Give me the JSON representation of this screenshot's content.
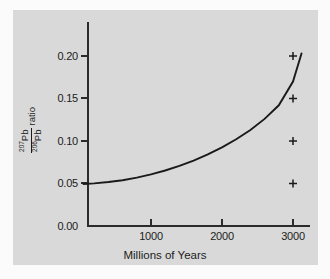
{
  "figure": {
    "background_color": "#fbfbfb",
    "panel_color": "#d9d9d9",
    "axis_color": "#2b2b2b",
    "curve_color": "#1a1a1a"
  },
  "axis_labels": {
    "x_label": "Millions of Years",
    "y_numerator_sup": "207",
    "y_numerator_el": "Pb",
    "y_denominator_sup": "206",
    "y_denominator_el": "Pb",
    "y_ratio_word": "ratio"
  },
  "chart_data": {
    "type": "line",
    "title": "",
    "xlabel": "Millions of Years",
    "ylabel": "207Pb/206Pb ratio",
    "xlim": [
      0,
      3200
    ],
    "ylim": [
      0.0,
      0.215
    ],
    "grid": false,
    "legend": false,
    "xticks": [
      1000,
      2000,
      3000
    ],
    "xtick_labels": [
      "1000",
      "2000",
      "3000"
    ],
    "yticks": [
      0.0,
      0.05,
      0.1,
      0.15,
      0.2
    ],
    "ytick_labels": [
      "0.00",
      "0.05",
      "0.10",
      "0.15",
      "0.20"
    ],
    "series": [
      {
        "name": "207Pb/206Pb growth curve",
        "type": "line",
        "x": [
          50,
          200,
          400,
          600,
          800,
          1000,
          1200,
          1400,
          1600,
          1800,
          2000,
          2200,
          2400,
          2600,
          2800,
          3000,
          3120
        ],
        "y": [
          0.0495,
          0.0502,
          0.0517,
          0.0539,
          0.0569,
          0.0607,
          0.0653,
          0.0707,
          0.077,
          0.0842,
          0.0925,
          0.102,
          0.113,
          0.126,
          0.142,
          0.17,
          0.203
        ]
      },
      {
        "name": "measured samples",
        "type": "scatter",
        "marker": "plus",
        "x": [
          3000,
          3000,
          3000,
          3000
        ],
        "y": [
          0.05,
          0.1,
          0.15,
          0.2
        ]
      }
    ]
  }
}
